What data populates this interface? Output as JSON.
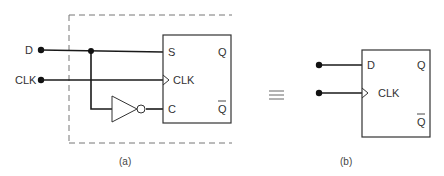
{
  "figure_a": {
    "caption": "(a)",
    "inputs": {
      "d": "D",
      "clk": "CLK"
    },
    "flipflop": {
      "pin_s": "S",
      "pin_clk": "CLK",
      "pin_c": "C",
      "out_q": "Q",
      "out_qbar": "Q"
    },
    "components": [
      "input-D",
      "input-CLK",
      "inverter",
      "SC-flipflop",
      "dashed-enclosure"
    ]
  },
  "equivalence_symbol": "≡",
  "figure_b": {
    "caption": "(b)",
    "flipflop": {
      "pin_d": "D",
      "pin_clk": "CLK",
      "out_q": "Q",
      "out_qbar": "Q"
    }
  },
  "colors": {
    "wire": "#1a1a1a",
    "box": "#333333",
    "dash": "#777777",
    "text": "#333333"
  }
}
